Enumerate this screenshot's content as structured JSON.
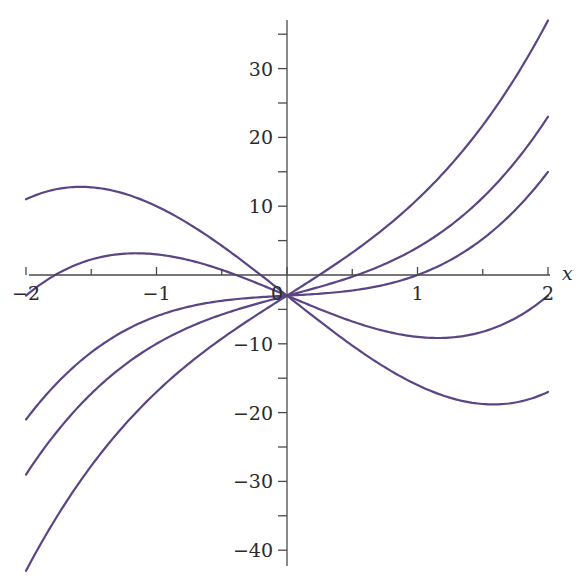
{
  "chart_data": {
    "type": "line",
    "title": "",
    "xlabel": "x",
    "ylabel": "",
    "xlim": [
      -2,
      2
    ],
    "ylim": [
      -43,
      37
    ],
    "grid": false,
    "legend": null,
    "x_ticks": [
      -2,
      -1,
      0,
      1,
      2
    ],
    "x_tick_labels": [
      "−2",
      "−1",
      "0",
      "1",
      "2"
    ],
    "x_minor_ticks": [
      -1.5,
      -0.5,
      0.5,
      1.5
    ],
    "y_ticks": [
      30,
      20,
      10,
      -10,
      -20,
      -30,
      -40
    ],
    "y_tick_labels": [
      "30",
      "20",
      "10",
      "−10",
      "−20",
      "−30",
      "−40"
    ],
    "y_minor_ticks": [
      35,
      25,
      15,
      5,
      -5,
      -15,
      -25,
      -35
    ],
    "family": "f(x) = 2x^3 + c x - 3",
    "series": [
      {
        "name": "c = 12",
        "c": 12,
        "x": [
          -2,
          -1.5,
          -1,
          -0.5,
          0,
          0.5,
          1,
          1.5,
          2
        ],
        "values": [
          -43,
          -27.75,
          -17,
          -9.25,
          -3,
          3.25,
          11,
          21.75,
          37
        ]
      },
      {
        "name": "c = 5",
        "c": 5,
        "x": [
          -2,
          -1.5,
          -1,
          -0.5,
          0,
          0.5,
          1,
          1.5,
          2
        ],
        "values": [
          -29,
          -17.25,
          -10,
          -5.75,
          -3,
          -0.25,
          4,
          11.25,
          23
        ]
      },
      {
        "name": "c = 1",
        "c": 1,
        "x": [
          -2,
          -1.5,
          -1,
          -0.5,
          0,
          0.5,
          1,
          1.5,
          2
        ],
        "values": [
          -21,
          -11.25,
          -6,
          -3.75,
          -3,
          -2.25,
          0,
          5.25,
          15
        ]
      },
      {
        "name": "c = -8",
        "c": -8,
        "x": [
          -2,
          -1.5,
          -1,
          -0.5,
          0,
          0.5,
          1,
          1.5,
          2
        ],
        "values": [
          -3,
          2.25,
          3,
          0.75,
          -3,
          -6.75,
          -9,
          -8.25,
          -3
        ]
      },
      {
        "name": "c = -15",
        "c": -15,
        "x": [
          -2,
          -1.5,
          -1,
          -0.5,
          0,
          0.5,
          1,
          1.5,
          2
        ],
        "values": [
          11,
          12.75,
          10,
          4.25,
          -3,
          -10.25,
          -16,
          -18.75,
          -17
        ]
      }
    ],
    "colors": {
      "curve": "#5b4585",
      "axis": "#4a4a4a",
      "text": "#2a2a2a",
      "background": "#ffffff"
    }
  },
  "labels": {
    "x_axis_name": "x"
  }
}
